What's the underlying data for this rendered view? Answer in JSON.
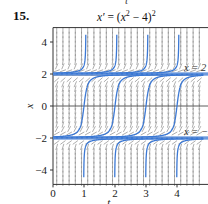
{
  "problem": {
    "number": "15."
  },
  "header": {
    "cut_label": "t"
  },
  "chart_data": {
    "type": "line",
    "title_parts": {
      "lhs": "x′",
      "eq": " = (",
      "var": "x",
      "sup": "2",
      "rest": " − 4)",
      "sup2": "2"
    },
    "xlabel": "t",
    "ylabel": "x",
    "xlim": [
      0,
      4.8
    ],
    "ylim": [
      -4.9,
      4.9
    ],
    "x_ticks": [
      0,
      1,
      2,
      3,
      4
    ],
    "x_tick_labels": [
      "0",
      "1",
      "2",
      "3",
      "4"
    ],
    "y_ticks": [
      4,
      2,
      0,
      -2,
      -4
    ],
    "y_tick_labels": [
      "4",
      "2",
      "0",
      "−2",
      "−4"
    ],
    "grid": false,
    "slope_field": true,
    "equilibria": [
      {
        "x": 2,
        "label": "x = 2"
      },
      {
        "x": -2,
        "label": "x = −2"
      }
    ],
    "series": [
      {
        "name": "upper-branch",
        "description": "solutions above x=2, asymptotic to x=2 as t→−∞, blow up vertically",
        "vertical_at_t": [
          1.05,
          2.05,
          3.05,
          4.05
        ]
      },
      {
        "name": "middle-branch",
        "description": "solutions between −2 and 2, increasing from x=−2 to x=2",
        "cross_zero_at_t": [
          1.0,
          2.0,
          3.0,
          4.0
        ]
      },
      {
        "name": "lower-branch",
        "description": "solutions below x=−2, rising vertically then leveling to x=−2",
        "vertical_at_t": [
          1.0,
          2.0,
          3.0,
          4.0
        ]
      }
    ],
    "colors": {
      "curves": "#3b78d4",
      "field": "#8a8a8a",
      "axis": "#333333"
    }
  }
}
